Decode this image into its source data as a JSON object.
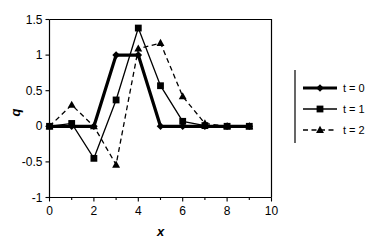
{
  "chart_data": {
    "type": "line",
    "title": "",
    "xlabel": "x",
    "ylabel": "q",
    "xlim": [
      0,
      10
    ],
    "ylim": [
      -1,
      1.5
    ],
    "x_ticks": [
      0,
      2,
      4,
      6,
      8,
      10
    ],
    "x_tick_labels": [
      "0",
      "2",
      "4",
      "6",
      "8",
      "10"
    ],
    "x_minor_ticks": [
      1,
      3,
      5,
      7,
      9
    ],
    "y_ticks": [
      -1,
      -0.5,
      0,
      0.5,
      1,
      1.5
    ],
    "y_tick_labels": [
      "-1",
      "-0.5",
      "0",
      "0.5",
      "1",
      "1.5"
    ],
    "grid": false,
    "legend_position": "right",
    "x": [
      0,
      1,
      2,
      3,
      4,
      5,
      6,
      7,
      8,
      9
    ],
    "series": [
      {
        "name": "t = 0",
        "marker": "diamond",
        "line": "solid-thick",
        "values": [
          0,
          0,
          0,
          1.0,
          1.0,
          0,
          0,
          0,
          0,
          0
        ]
      },
      {
        "name": "t = 1",
        "marker": "square",
        "line": "solid-thin",
        "values": [
          0,
          0.04,
          -0.45,
          0.37,
          1.38,
          0.57,
          0.07,
          0.01,
          0,
          0
        ]
      },
      {
        "name": "t = 2",
        "marker": "triangle",
        "line": "dashed",
        "values": [
          0,
          0.3,
          0.0,
          -0.54,
          1.09,
          1.17,
          0.42,
          0.04,
          0,
          0
        ]
      }
    ]
  },
  "legend": {
    "items": [
      {
        "label": "t = 0"
      },
      {
        "label": "t = 1"
      },
      {
        "label": "t = 2"
      }
    ]
  },
  "axes": {
    "x_title": "x",
    "y_title": "q"
  }
}
